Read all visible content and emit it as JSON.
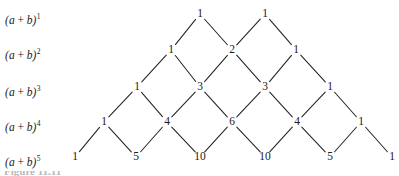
{
  "figure": {
    "caption_partial": "Figure 11.11",
    "background_color": "#ffffff",
    "ink_color": "#1a1a1a",
    "line_color": "#232323"
  },
  "row_labels": [
    {
      "id": "row-label-1",
      "base": "(a",
      "op": "+",
      "var": "b)",
      "exponent": "1",
      "x": 5,
      "y": 15
    },
    {
      "id": "row-label-2",
      "base": "(a",
      "op": "+",
      "var": "b)",
      "exponent": "2",
      "x": 5,
      "y": 50
    },
    {
      "id": "row-label-3",
      "base": "(a",
      "op": "+",
      "var": "b)",
      "exponent": "3",
      "x": 5,
      "y": 87
    },
    {
      "id": "row-label-4",
      "base": "(a",
      "op": "+",
      "var": "b)",
      "exponent": "4",
      "x": 5,
      "y": 122
    },
    {
      "id": "row-label-5",
      "base": "(a",
      "op": "+",
      "var": "b)",
      "exponent": "5",
      "x": 5,
      "y": 157
    }
  ],
  "chart_data": {
    "type": "diagram",
    "xlabel": "",
    "ylabel": "",
    "rows": [
      {
        "power": 1,
        "y": 14,
        "values": [
          1,
          1
        ],
        "x": [
          200,
          265
        ]
      },
      {
        "power": 2,
        "y": 50,
        "values": [
          1,
          2,
          1
        ],
        "x": [
          171,
          232,
          296
        ]
      },
      {
        "power": 3,
        "y": 87,
        "values": [
          1,
          3,
          3,
          1
        ],
        "x": [
          137,
          200,
          265,
          330
        ]
      },
      {
        "power": 4,
        "y": 122,
        "values": [
          1,
          4,
          6,
          4,
          1
        ],
        "x": [
          104,
          167,
          232,
          297,
          361
        ]
      },
      {
        "power": 5,
        "y": 157,
        "values": [
          1,
          5,
          10,
          10,
          5,
          1
        ],
        "x": [
          75,
          136,
          200,
          265,
          330,
          392
        ]
      }
    ],
    "edges_note": "Each interior entry is connected by two short diagonal line segments to the two entries directly above it."
  }
}
